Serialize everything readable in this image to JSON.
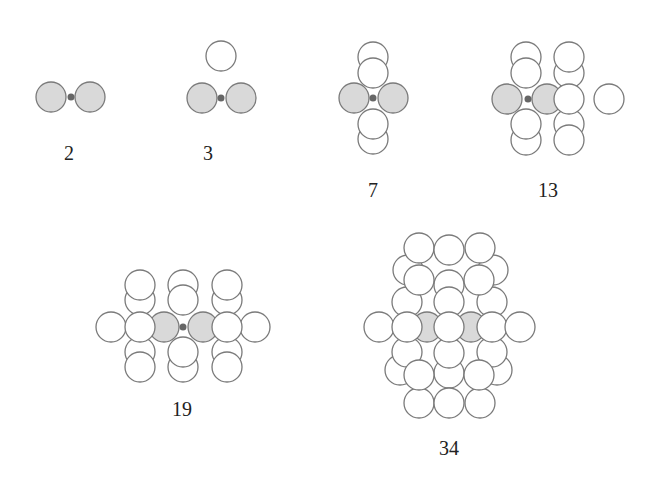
{
  "figure": {
    "colors": {
      "background": "#ffffff",
      "stroke": "#7a7a7a",
      "shaded_fill": "#d9d9d9",
      "open_fill": "#ffffff",
      "center_dot": "#666666",
      "label": "#222222"
    },
    "radius": 15,
    "clusters": [
      {
        "label": "2",
        "label_pos": [
          69,
          160
        ],
        "dot": [
          71,
          97
        ],
        "circles": [
          {
            "x": 51,
            "y": 97,
            "shaded": true
          },
          {
            "x": 90,
            "y": 97,
            "shaded": true
          }
        ]
      },
      {
        "label": "3",
        "label_pos": [
          208,
          160
        ],
        "dot": [
          221,
          98
        ],
        "circles": [
          {
            "x": 221,
            "y": 56,
            "shaded": false
          },
          {
            "x": 202,
            "y": 98,
            "shaded": true
          },
          {
            "x": 241,
            "y": 98,
            "shaded": true
          }
        ]
      },
      {
        "label": "7",
        "label_pos": [
          373,
          197
        ],
        "dot": [
          373,
          98
        ],
        "circles": [
          {
            "x": 373,
            "y": 57,
            "shaded": false
          },
          {
            "x": 373,
            "y": 73,
            "shaded": false
          },
          {
            "x": 373,
            "y": 139,
            "shaded": false
          },
          {
            "x": 373,
            "y": 124,
            "shaded": false
          },
          {
            "x": 354,
            "y": 98,
            "shaded": true
          },
          {
            "x": 393,
            "y": 98,
            "shaded": true
          }
        ]
      },
      {
        "label": "13",
        "label_pos": [
          548,
          197
        ],
        "dot": [
          528,
          99
        ],
        "circles": [
          {
            "x": 526,
            "y": 57,
            "shaded": false
          },
          {
            "x": 526,
            "y": 73,
            "shaded": false
          },
          {
            "x": 526,
            "y": 140,
            "shaded": false
          },
          {
            "x": 526,
            "y": 124,
            "shaded": false
          },
          {
            "x": 569,
            "y": 73,
            "shaded": false
          },
          {
            "x": 569,
            "y": 57,
            "shaded": false
          },
          {
            "x": 569,
            "y": 124,
            "shaded": false
          },
          {
            "x": 569,
            "y": 140,
            "shaded": false
          },
          {
            "x": 507,
            "y": 99,
            "shaded": true
          },
          {
            "x": 547,
            "y": 99,
            "shaded": true
          },
          {
            "x": 609,
            "y": 99,
            "shaded": false
          },
          {
            "x": 569,
            "y": 99,
            "shaded": false
          }
        ]
      },
      {
        "label": "19",
        "label_pos": [
          182,
          416
        ],
        "dot": [
          183,
          327
        ],
        "circles": [
          {
            "x": 140,
            "y": 300,
            "shaded": false
          },
          {
            "x": 140,
            "y": 285,
            "shaded": false
          },
          {
            "x": 183,
            "y": 285,
            "shaded": false
          },
          {
            "x": 183,
            "y": 300,
            "shaded": false
          },
          {
            "x": 227,
            "y": 300,
            "shaded": false
          },
          {
            "x": 227,
            "y": 285,
            "shaded": false
          },
          {
            "x": 140,
            "y": 352,
            "shaded": false,
            "partial": true
          },
          {
            "x": 140,
            "y": 367,
            "shaded": false,
            "partial": true
          },
          {
            "x": 183,
            "y": 367,
            "shaded": false,
            "partial": true
          },
          {
            "x": 183,
            "y": 352,
            "shaded": false
          },
          {
            "x": 227,
            "y": 352,
            "shaded": false,
            "partial": true
          },
          {
            "x": 227,
            "y": 367,
            "shaded": false,
            "partial": true
          },
          {
            "x": 111,
            "y": 327,
            "shaded": false
          },
          {
            "x": 255,
            "y": 327,
            "shaded": false
          },
          {
            "x": 164,
            "y": 327,
            "shaded": true
          },
          {
            "x": 203,
            "y": 327,
            "shaded": true
          },
          {
            "x": 140,
            "y": 327,
            "shaded": false
          },
          {
            "x": 227,
            "y": 327,
            "shaded": false
          }
        ]
      },
      {
        "label": "34",
        "label_pos": [
          449,
          455
        ],
        "dot": null,
        "circles": [
          {
            "x": 408,
            "y": 270,
            "shaded": false
          },
          {
            "x": 493,
            "y": 270,
            "shaded": false
          },
          {
            "x": 407,
            "y": 302,
            "shaded": false
          },
          {
            "x": 492,
            "y": 302,
            "shaded": false
          },
          {
            "x": 449,
            "y": 285,
            "shaded": false
          },
          {
            "x": 419,
            "y": 248,
            "shaded": false
          },
          {
            "x": 449,
            "y": 250,
            "shaded": false
          },
          {
            "x": 480,
            "y": 248,
            "shaded": false
          },
          {
            "x": 419,
            "y": 280,
            "shaded": false
          },
          {
            "x": 479,
            "y": 280,
            "shaded": false
          },
          {
            "x": 449,
            "y": 302,
            "shaded": false
          },
          {
            "x": 400,
            "y": 370,
            "shaded": false,
            "partial": true
          },
          {
            "x": 497,
            "y": 370,
            "shaded": false,
            "partial": true
          },
          {
            "x": 407,
            "y": 352,
            "shaded": false
          },
          {
            "x": 492,
            "y": 352,
            "shaded": false
          },
          {
            "x": 449,
            "y": 373,
            "shaded": false,
            "partial": true
          },
          {
            "x": 449,
            "y": 353,
            "shaded": false
          },
          {
            "x": 427,
            "y": 327,
            "shaded": true
          },
          {
            "x": 471,
            "y": 327,
            "shaded": true
          },
          {
            "x": 379,
            "y": 327,
            "shaded": false
          },
          {
            "x": 407,
            "y": 327,
            "shaded": false
          },
          {
            "x": 449,
            "y": 327,
            "shaded": false
          },
          {
            "x": 492,
            "y": 327,
            "shaded": false
          },
          {
            "x": 520,
            "y": 327,
            "shaded": false
          },
          {
            "x": 419,
            "y": 403,
            "shaded": false,
            "partial": true
          },
          {
            "x": 449,
            "y": 403,
            "shaded": false
          },
          {
            "x": 480,
            "y": 403,
            "shaded": false,
            "partial": true
          },
          {
            "x": 419,
            "y": 375,
            "shaded": false
          },
          {
            "x": 479,
            "y": 375,
            "shaded": false
          }
        ]
      }
    ]
  }
}
